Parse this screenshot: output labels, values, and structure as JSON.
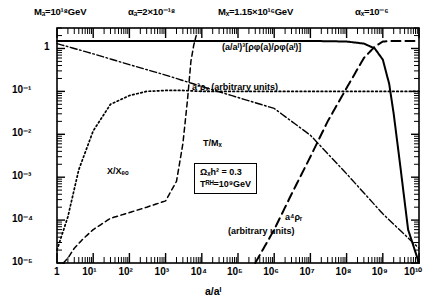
{
  "header": {
    "params": [
      {
        "name": "m-phi-param",
        "text": "Mₐ=10¹⁸GeV"
      },
      {
        "name": "alpha-phi-param",
        "text": "αₐ=2×10⁻¹⁸"
      },
      {
        "name": "m-x-param",
        "text": "Mₓ=1.15×10¹⁶GeV"
      },
      {
        "name": "alpha-x-param",
        "text": "αₓ=10⁻⁶"
      }
    ]
  },
  "axes": {
    "x_label": "a/aᴵ",
    "x_ticks": [
      "1",
      "10¹",
      "10²",
      "10³",
      "10⁴",
      "10⁵",
      "10⁶",
      "10⁷",
      "10⁸",
      "10⁹",
      "10¹⁰"
    ],
    "y_ticks": [
      "1",
      "10⁻¹",
      "10⁻²",
      "10⁻³",
      "10⁻⁴",
      "10⁻⁵"
    ]
  },
  "annotations": {
    "phi_density": "(a/aᴵ)³[ρφ(a)/ρφ(aᴵ)]",
    "x_density": "a³ρₓ (arbitrary units)",
    "temperature": "T/Mₓ",
    "x_over_xeq": "X/Xₑₒ",
    "r_density_line1": "a⁴ρᵣ",
    "r_density_line2": "(arbitrary units)",
    "box_line1": "Ωₓh² = 0.3",
    "box_line2": "Tᴿᴴ=10⁹GeV"
  },
  "colors": {
    "ink": "#000000",
    "background": "#ffffff"
  },
  "chart_data": {
    "type": "line",
    "title": "",
    "xlabel": "a/a_I",
    "ylabel": "",
    "xscale": "log",
    "yscale": "log",
    "xlim": [
      1,
      10000000000.0
    ],
    "ylim": [
      1e-05,
      3
    ],
    "grid": false,
    "legend": "inline-annotations",
    "series": [
      {
        "name": "(a/a_I)^3 [rho_phi(a)/rho_phi(a_I)]",
        "style": "solid",
        "label_position": "top-right",
        "x": [
          1,
          10,
          100.0,
          1000.0,
          10000.0,
          100000.0,
          1000000.0,
          10000000.0,
          100000000.0,
          300000000.0,
          600000000.0,
          1000000000.0,
          1500000000.0,
          2000000000.0,
          3000000000.0,
          5000000000.0,
          10000000000.0
        ],
        "y": [
          1.5,
          1.5,
          1.5,
          1.5,
          1.5,
          1.5,
          1.5,
          1.5,
          1.45,
          1.3,
          1.0,
          0.55,
          0.15,
          0.03,
          0.002,
          6e-05,
          1e-05
        ]
      },
      {
        "name": "a^3 rho_X (arbitrary units)",
        "style": "dotted",
        "label_position": "upper-middle",
        "x": [
          1,
          2,
          4,
          10,
          30,
          100.0,
          300.0,
          1000.0,
          3000.0,
          10000.0,
          100000.0,
          1000000.0,
          10000000.0,
          100000000.0,
          1000000000.0,
          10000000000.0
        ],
        "y": [
          2e-05,
          0.00012,
          0.0015,
          0.012,
          0.05,
          0.08,
          0.1,
          0.105,
          0.105,
          0.1,
          0.1,
          0.1,
          0.1,
          0.1,
          0.1,
          0.1
        ]
      },
      {
        "name": "T/M_X",
        "style": "dash-dot",
        "label_position": "center",
        "x": [
          1,
          10,
          100.0,
          1000.0,
          10000.0,
          100000.0,
          1000000.0,
          10000000.0,
          100000000.0,
          1000000000.0,
          10000000000.0
        ],
        "y": [
          1.3,
          0.75,
          0.42,
          0.24,
          0.13,
          0.072,
          0.04,
          0.0095,
          0.0012,
          0.00014,
          2.2e-05
        ]
      },
      {
        "name": "X/X_EQ",
        "style": "dashed",
        "label_position": "lower-left",
        "x": [
          1.5,
          2,
          3,
          5,
          10,
          30,
          100.0,
          300.0,
          1000.0,
          2000.0,
          3000.0,
          4000.0,
          5000.0,
          6000.0,
          7000.0
        ],
        "y": [
          1e-05,
          1.3e-05,
          2.2e-05,
          3.5e-05,
          6e-05,
          0.00011,
          0.00015,
          0.0002,
          0.00028,
          0.0008,
          0.006,
          0.06,
          0.5,
          1.2,
          2.0
        ]
      },
      {
        "name": "a^4 rho_R (arbitrary units)",
        "style": "long-dashed",
        "label_position": "lower-right",
        "x": [
          300000.0,
          1000000.0,
          3000000.0,
          10000000.0,
          30000000.0,
          100000000.0,
          300000000.0,
          600000000.0,
          1000000000.0,
          2000000000.0,
          4000000000.0,
          10000000000.0
        ],
        "y": [
          1e-05,
          6e-05,
          0.0004,
          0.003,
          0.02,
          0.12,
          0.6,
          1.1,
          1.45,
          1.5,
          1.5,
          1.5
        ]
      }
    ]
  }
}
